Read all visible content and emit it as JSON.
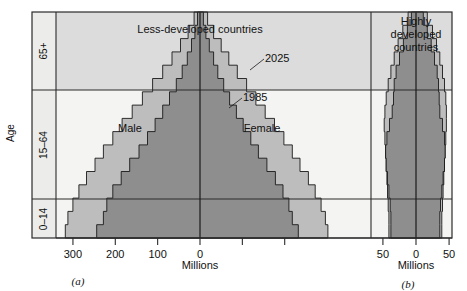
{
  "figure": {
    "axis_y_title": "Age",
    "age_groups": [
      {
        "label": "65+",
        "y_top": 12,
        "y_bottom": 90
      },
      {
        "label": "15–64",
        "y_top": 90,
        "y_bottom": 199
      },
      {
        "label": "0–14",
        "y_top": 199,
        "y_bottom": 238
      }
    ],
    "colors": {
      "band_top_bg": "#dcdcdc",
      "band_mid_bg": "#f4f4f2",
      "band_bot_bg": "#f4f4f2",
      "label_strip_bg": "#ececea",
      "series_2025": "#bdbdbd",
      "series_1985": "#8e8e8e",
      "frame": "#2b2b2b",
      "text": "#111111",
      "page_bg": "#ffffff"
    },
    "panels": [
      {
        "key": "a",
        "caption": "(a)",
        "title": "Less-developed countries",
        "x_axis_label": "Millions",
        "tick_values": [
          300,
          200,
          100,
          0,
          100,
          200
        ],
        "tick_labels": [
          "300",
          "200",
          "100",
          "0",
          "",
          ""
        ],
        "sex_labels": {
          "left": "Male",
          "right": "Female"
        },
        "series_annotations": [
          {
            "name": "2025",
            "label": "2025"
          },
          {
            "name": "1985",
            "label": "1985"
          }
        ]
      },
      {
        "key": "b",
        "caption": "(b)",
        "title_lines": [
          "Highly",
          "developed",
          "countries"
        ],
        "x_axis_label": "Millions",
        "tick_values": [
          50,
          0,
          50
        ],
        "tick_labels": [
          "50",
          "0",
          "50"
        ]
      }
    ]
  },
  "chart_data": {
    "type": "bar",
    "chart_kind": "population-pyramid",
    "xlabel": "Millions",
    "ylabel": "Age",
    "grid": false,
    "legend": "inline annotations (2025 outer, 1985 inner)",
    "age_bins": [
      "0–4",
      "5–9",
      "10–14",
      "15–19",
      "20–24",
      "25–29",
      "30–34",
      "35–39",
      "40–44",
      "45–49",
      "50–54",
      "55–59",
      "60–64",
      "65–69",
      "70–74",
      "75–79",
      "80+"
    ],
    "age_group_bands": [
      "0–14",
      "15–64",
      "65+"
    ],
    "panels": [
      {
        "key": "a",
        "name": "Less-developed countries",
        "xlim": [
          -340,
          240
        ],
        "xticks": [
          -300,
          -200,
          -100,
          0,
          100,
          200
        ],
        "xticklabels": [
          "300",
          "200",
          "100",
          "0",
          "",
          ""
        ],
        "units": "Millions",
        "series": [
          {
            "name": "2025",
            "male": [
              318,
              312,
              300,
              286,
              268,
              248,
              228,
              206,
              184,
              160,
              136,
              112,
              88,
              66,
              46,
              28,
              14
            ],
            "female": [
              302,
              296,
              286,
              272,
              256,
              236,
              218,
              198,
              176,
              154,
              132,
              110,
              88,
              68,
              50,
              32,
              18
            ]
          },
          {
            "name": "1985",
            "male": [
              244,
              228,
              220,
              206,
              186,
              166,
              144,
              124,
              106,
              88,
              72,
              56,
              42,
              30,
              20,
              12,
              6
            ],
            "female": [
              232,
              218,
              210,
              196,
              178,
              158,
              138,
              120,
              102,
              86,
              70,
              56,
              42,
              32,
              22,
              14,
              8
            ]
          }
        ]
      },
      {
        "key": "b",
        "name": "Highly developed countries",
        "xlim": [
          -68,
          68
        ],
        "xticks": [
          -50,
          0,
          50
        ],
        "xticklabels": [
          "50",
          "0",
          "50"
        ],
        "units": "Millions",
        "series": [
          {
            "name": "2025",
            "male": [
              41,
              41,
              42,
              43,
              44,
              45,
              46,
              47,
              48,
              47,
              45,
              42,
              38,
              33,
              27,
              20,
              12
            ],
            "female": [
              39,
              39,
              40,
              41,
              42,
              43,
              44,
              45,
              46,
              46,
              45,
              43,
              40,
              36,
              31,
              25,
              17
            ]
          },
          {
            "name": "1985",
            "male": [
              38,
              38,
              39,
              41,
              43,
              45,
              46,
              44,
              40,
              36,
              34,
              33,
              30,
              25,
              19,
              13,
              7
            ],
            "female": [
              36,
              36,
              37,
              39,
              41,
              43,
              44,
              43,
              40,
              36,
              35,
              34,
              32,
              28,
              23,
              17,
              11
            ]
          }
        ]
      }
    ]
  }
}
